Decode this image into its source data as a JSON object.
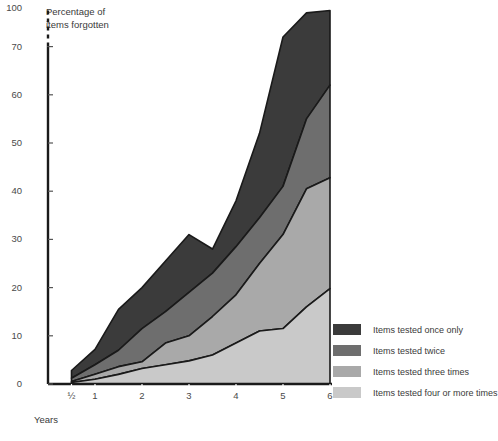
{
  "chart_data": {
    "type": "area",
    "stacked": true,
    "title": "",
    "ylabel": "Percentage of items forgotten",
    "xlabel": "Years",
    "x": [
      0.5,
      1,
      1.5,
      2,
      2.5,
      3,
      3.5,
      4,
      4.5,
      5,
      5.5,
      6
    ],
    "xtick_labels": [
      "½",
      "1",
      "2",
      "3",
      "4",
      "5",
      "6"
    ],
    "xtick_values": [
      0.5,
      1,
      2,
      3,
      4,
      5,
      6
    ],
    "ytick_labels": [
      "0",
      "10",
      "20",
      "30",
      "40",
      "50",
      "60",
      "70",
      "100"
    ],
    "ytick_values": [
      0,
      10,
      20,
      30,
      40,
      50,
      60,
      70,
      100
    ],
    "ylim": [
      0,
      78
    ],
    "axis_break": true,
    "axis_break_between": [
      70,
      100
    ],
    "grid": false,
    "legend_position": "right",
    "series": [
      {
        "name": "Items tested four or more times",
        "color": "#c9c9c9",
        "values": [
          0.3,
          1.0,
          2.0,
          3.2,
          4.0,
          4.8,
          6.0,
          8.5,
          11.0,
          11.5,
          16.0,
          19.8
        ]
      },
      {
        "name": "Items tested three times",
        "color": "#a9a9a9",
        "values": [
          0.5,
          2.0,
          3.6,
          4.6,
          8.5,
          10.0,
          14.0,
          18.5,
          25.0,
          31.0,
          40.5,
          42.8
        ]
      },
      {
        "name": "Items tested twice",
        "color": "#6e6e6e",
        "values": [
          1.2,
          4.0,
          7.0,
          11.5,
          15.0,
          19.0,
          23.0,
          28.5,
          34.5,
          41.0,
          55.0,
          62.0
        ]
      },
      {
        "name": "Items tested once only",
        "color": "#3b3b3b",
        "values": [
          2.8,
          7.2,
          15.5,
          20.0,
          25.5,
          31.0,
          28.0,
          38.0,
          52.0,
          72.0,
          77.0,
          77.5
        ]
      }
    ]
  },
  "legend": {
    "items": [
      {
        "label": "Items tested once only",
        "color": "#3b3b3b"
      },
      {
        "label": "Items tested twice",
        "color": "#6e6e6e"
      },
      {
        "label": "Items tested three times",
        "color": "#a9a9a9"
      },
      {
        "label": "Items tested four or more times",
        "color": "#c9c9c9"
      }
    ]
  },
  "axes": {
    "y_title_line1": "Percentage of",
    "y_title_line2": "items forgotten",
    "x_title": "Years"
  }
}
